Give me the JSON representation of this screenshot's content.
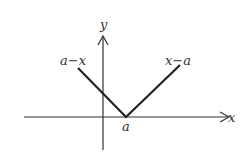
{
  "diagram": {
    "axes": {
      "x_label": "x",
      "y_label": "y"
    },
    "labels": {
      "left_branch": "a−x",
      "right_branch": "x−a",
      "vertex": "a"
    },
    "colors": {
      "line": "#222222",
      "text": "#333333",
      "background": "#ffffff"
    }
  }
}
